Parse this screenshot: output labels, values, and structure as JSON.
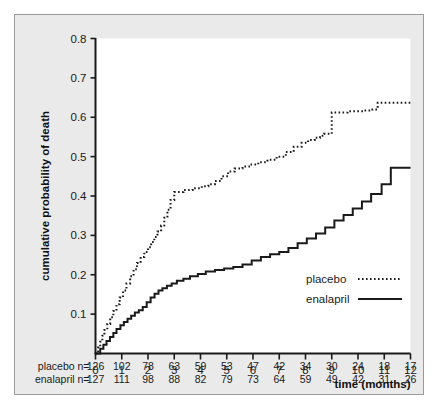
{
  "figure": {
    "background_color": "#eaeaea",
    "plot_background_color": "#ffffff",
    "axis_color": "#1a1a1a"
  },
  "chart_data": {
    "type": "line",
    "subtype": "kaplan-meier-step",
    "title": "",
    "xlabel": "time (months)",
    "ylabel": "cumulative probability of death",
    "xlim": [
      0,
      12
    ],
    "ylim": [
      0,
      0.8
    ],
    "xticks": [
      0,
      1,
      2,
      3,
      4,
      5,
      6,
      7,
      8,
      9,
      10,
      11,
      12
    ],
    "xticklabels": [
      "0",
      "1",
      "2",
      "3",
      "4",
      "5",
      "6",
      "7",
      "8",
      "9",
      "10",
      "11",
      "12"
    ],
    "yticks": [
      0.1,
      0.2,
      0.3,
      0.4,
      0.5,
      0.6,
      0.7,
      0.8
    ],
    "yticklabels": [
      "0.1",
      "0.2",
      "0.3",
      "0.4",
      "0.5",
      "0.6",
      "0.7",
      "0.8"
    ],
    "grid": false,
    "legend_position": "lower-right-inside",
    "series": [
      {
        "name": "placebo",
        "style": "dotted",
        "color": "#1a1a1a",
        "x": [
          0.0,
          0.1,
          0.18,
          0.26,
          0.34,
          0.45,
          0.56,
          0.68,
          0.8,
          0.92,
          1.05,
          1.18,
          1.32,
          1.45,
          1.58,
          1.72,
          1.86,
          2.0,
          2.12,
          2.24,
          2.36,
          2.5,
          2.62,
          2.74,
          2.86,
          3.0,
          3.35,
          3.7,
          4.05,
          4.3,
          4.55,
          4.8,
          5.05,
          5.3,
          5.6,
          5.9,
          6.2,
          6.55,
          6.9,
          7.25,
          7.55,
          7.85,
          8.1,
          8.35,
          8.55,
          8.7,
          9.0,
          9.6,
          10.2,
          10.55,
          10.75,
          11.2,
          12.0
        ],
        "y": [
          0.0,
          0.015,
          0.03,
          0.045,
          0.06,
          0.075,
          0.092,
          0.108,
          0.125,
          0.142,
          0.16,
          0.178,
          0.196,
          0.214,
          0.23,
          0.245,
          0.258,
          0.27,
          0.283,
          0.296,
          0.31,
          0.325,
          0.345,
          0.365,
          0.39,
          0.41,
          0.415,
          0.42,
          0.425,
          0.43,
          0.438,
          0.45,
          0.462,
          0.47,
          0.475,
          0.48,
          0.486,
          0.492,
          0.5,
          0.512,
          0.525,
          0.535,
          0.542,
          0.548,
          0.553,
          0.558,
          0.612,
          0.615,
          0.617,
          0.62,
          0.637,
          0.637,
          0.637
        ]
      },
      {
        "name": "enalapril",
        "style": "solid",
        "color": "#1a1a1a",
        "x": [
          0.0,
          0.18,
          0.3,
          0.42,
          0.55,
          0.68,
          0.8,
          0.95,
          1.08,
          1.22,
          1.36,
          1.5,
          1.65,
          1.8,
          1.95,
          2.1,
          2.25,
          2.4,
          2.55,
          2.72,
          2.9,
          3.1,
          3.35,
          3.6,
          3.9,
          4.2,
          4.55,
          4.9,
          5.25,
          5.6,
          5.95,
          6.3,
          6.65,
          7.0,
          7.35,
          7.7,
          8.05,
          8.4,
          8.75,
          9.1,
          9.45,
          9.8,
          10.15,
          10.5,
          10.9,
          11.25,
          12.0
        ],
        "y": [
          0.0,
          0.012,
          0.022,
          0.032,
          0.042,
          0.052,
          0.062,
          0.072,
          0.08,
          0.088,
          0.096,
          0.104,
          0.11,
          0.118,
          0.13,
          0.142,
          0.152,
          0.16,
          0.166,
          0.172,
          0.178,
          0.185,
          0.19,
          0.196,
          0.202,
          0.208,
          0.212,
          0.216,
          0.22,
          0.226,
          0.236,
          0.245,
          0.252,
          0.258,
          0.268,
          0.28,
          0.292,
          0.305,
          0.32,
          0.338,
          0.352,
          0.368,
          0.386,
          0.405,
          0.43,
          0.472,
          0.472
        ]
      }
    ],
    "annotations": []
  },
  "legend": {
    "items": [
      {
        "label": "placebo",
        "style": "dotted"
      },
      {
        "label": "enalapril",
        "style": "solid"
      }
    ]
  },
  "risk_table": {
    "rows": [
      {
        "label": "placebo n=",
        "values": [
          "126",
          "102",
          "78",
          "63",
          "59",
          "53",
          "47",
          "42",
          "34",
          "30",
          "24",
          "18",
          "17"
        ]
      },
      {
        "label": "enalapril n=",
        "values": [
          "127",
          "111",
          "98",
          "88",
          "82",
          "79",
          "73",
          "64",
          "59",
          "49",
          "42",
          "31",
          "26"
        ]
      }
    ]
  }
}
